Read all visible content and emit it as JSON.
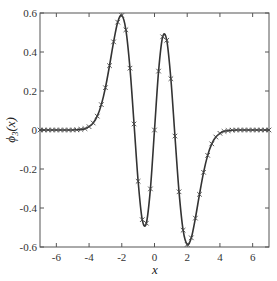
{
  "chart_data": {
    "type": "line",
    "title": "",
    "xlabel": "x",
    "ylabel": "ϕ3(x)",
    "xlim": [
      -7,
      7
    ],
    "ylim": [
      -0.6,
      0.6
    ],
    "grid": false,
    "legend": "none",
    "x_ticks": [
      -6,
      -4,
      -2,
      0,
      2,
      4,
      6
    ],
    "x_tick_labels": [
      "-6",
      "-4",
      "-2",
      "0",
      "2",
      "4",
      "6"
    ],
    "y_ticks": [
      0.6,
      0.4,
      0.2,
      0,
      -0.2,
      -0.4,
      -0.6
    ],
    "y_tick_labels": [
      "0.6",
      "0.4",
      "0.2",
      "0",
      "-0.2",
      "-0.4",
      "-0.6"
    ],
    "series": [
      {
        "name": "phi3 (solid line with x markers)",
        "style": "solid line with x markers",
        "color": "#333333",
        "x": [
          -7,
          -6.75,
          -6.5,
          -6.25,
          -6,
          -5.75,
          -5.5,
          -5.25,
          -5,
          -4.75,
          -4.5,
          -4.25,
          -4,
          -3.75,
          -3.5,
          -3.25,
          -3,
          -2.75,
          -2.5,
          -2.25,
          -2,
          -1.75,
          -1.5,
          -1.25,
          -1,
          -0.75,
          -0.5,
          -0.25,
          0,
          0.25,
          0.5,
          0.75,
          1,
          1.25,
          1.5,
          1.75,
          2,
          2.25,
          2.5,
          2.75,
          3,
          3.25,
          3.5,
          3.75,
          4,
          4.25,
          4.5,
          4.75,
          5,
          5.25,
          5.5,
          5.75,
          6,
          6.25,
          6.5,
          6.75,
          7
        ],
        "y": [
          0,
          0,
          0,
          0,
          0,
          0,
          0,
          0,
          0,
          0.001,
          0.003,
          0.007,
          0.017,
          0.036,
          0.071,
          0.13,
          0.217,
          0.33,
          0.452,
          0.553,
          0.587,
          0.514,
          0.317,
          0.031,
          -0.263,
          -0.46,
          -0.478,
          -0.302,
          0,
          0.302,
          0.478,
          0.46,
          0.263,
          -0.031,
          -0.317,
          -0.514,
          -0.587,
          -0.553,
          -0.452,
          -0.33,
          -0.217,
          -0.13,
          -0.071,
          -0.036,
          -0.017,
          -0.007,
          -0.003,
          -0.001,
          0,
          0,
          0,
          0,
          0,
          0,
          0,
          0,
          0
        ]
      }
    ]
  },
  "labels": {
    "xlabel": "x",
    "ylabel_main": "ϕ",
    "ylabel_sub": "3",
    "ylabel_arg": "(x)"
  }
}
